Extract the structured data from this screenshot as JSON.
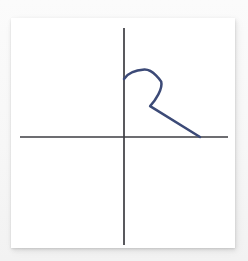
{
  "figure": {
    "title": "",
    "background_color": "#f7f7f7",
    "card_color": "#ffffff",
    "axis_color": "#3c3c42",
    "curve_color": "#3c4a77"
  },
  "chart_data": {
    "type": "line",
    "title": "",
    "subtitle": "",
    "xlabel": "",
    "ylabel": "",
    "grid": false,
    "legend": null,
    "legend_position": "none",
    "axes": {
      "origin_px": [
        124,
        137
      ],
      "x_axis_extent_px": [
        20,
        228
      ],
      "y_axis_extent_px": [
        28,
        245
      ],
      "x_tick_labels": [],
      "y_tick_labels": [],
      "xlim": [
        -104,
        104
      ],
      "ylim": [
        -108,
        109
      ]
    },
    "annotations": [],
    "series": [
      {
        "name": "curve",
        "color": "#3c4a77",
        "closed": false,
        "points_px": [
          [
            124,
            79
          ],
          [
            133,
            72
          ],
          [
            144,
            70
          ],
          [
            154,
            73
          ],
          [
            160,
            81
          ],
          [
            161,
            91
          ],
          [
            156,
            100
          ],
          [
            150,
            106
          ],
          [
            200,
            137
          ]
        ],
        "key_points": {
          "start_on_y_axis_px": [
            124,
            79
          ],
          "loop_apex_px": [
            145,
            70
          ],
          "loop_rightmost_px": [
            161,
            89
          ],
          "cusp_px": [
            150,
            106
          ],
          "end_on_x_axis_px": [
            200,
            137
          ]
        }
      }
    ]
  }
}
